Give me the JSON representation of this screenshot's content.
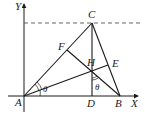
{
  "diagram": {
    "type": "geometry",
    "colors": {
      "line": "#1a1a1a",
      "background": "#ffffff",
      "dashed": "#555555"
    },
    "labels": {
      "y_axis": "Y",
      "x_axis": "X",
      "A": "A",
      "B": "B",
      "C": "C",
      "D": "D",
      "E": "E",
      "F": "F",
      "H": "H",
      "theta_at_A": "θ",
      "theta_at_H": "θ"
    },
    "points": {
      "A": [
        24,
        96
      ],
      "B": [
        120,
        96
      ],
      "C": [
        92,
        23
      ],
      "D": [
        92,
        96
      ],
      "E": [
        108,
        65
      ],
      "F": [
        67,
        50
      ],
      "H": [
        92,
        71
      ]
    },
    "segments": [
      [
        "A",
        "C"
      ],
      [
        "C",
        "B"
      ],
      [
        "A",
        "B"
      ],
      [
        "C",
        "D"
      ],
      [
        "A",
        "E"
      ],
      [
        "B",
        "F"
      ]
    ],
    "dashed_line": "horizontal line through C parallel to X axis"
  }
}
